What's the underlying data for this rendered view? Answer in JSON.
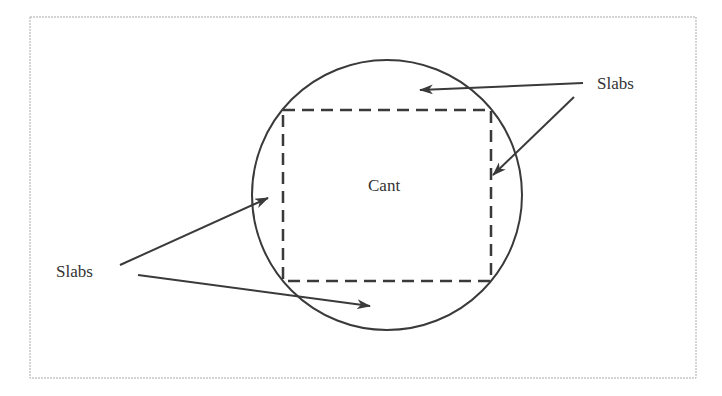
{
  "diagram": {
    "center_label": "Cant",
    "labels": {
      "top_right": "Slabs",
      "left": "Slabs"
    },
    "colors": {
      "stroke": "#3a3a3a",
      "frame": "#aaaaaa",
      "text": "#333333"
    }
  }
}
